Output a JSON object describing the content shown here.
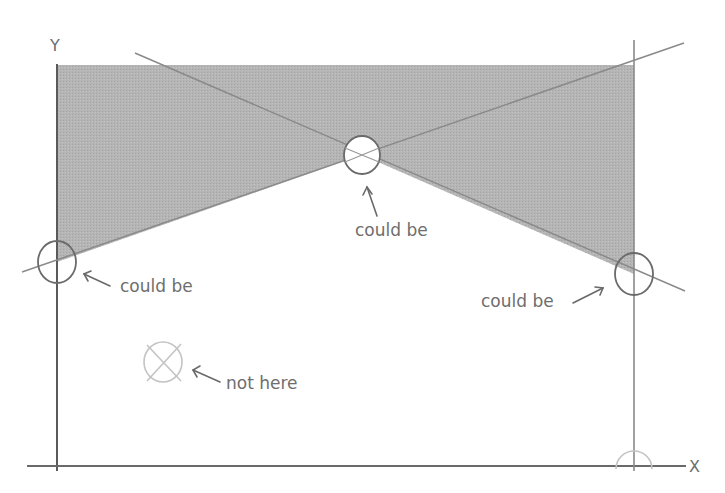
{
  "diagram": {
    "axes": {
      "x_label": "X",
      "y_label": "Y"
    },
    "annotations": [
      {
        "id": "left",
        "text": "could be",
        "arrow": "pointing-left-up"
      },
      {
        "id": "center",
        "text": "could be",
        "arrow": "pointing-up"
      },
      {
        "id": "right",
        "text": "could be",
        "arrow": "pointing-right-up"
      },
      {
        "id": "not-here",
        "text": "not here",
        "arrow": "pointing-left-up"
      }
    ],
    "colors": {
      "shading": "#b3b3b3",
      "axis": "#5a5a5a",
      "line": "#8a8a8a",
      "circle": "#6a6a6a",
      "faded_circle": "#c4c4c4",
      "text": "#6e6e6e"
    }
  }
}
